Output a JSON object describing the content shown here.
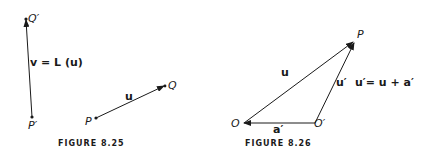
{
  "figure_8_25": {
    "caption": "FIGURE 8.25",
    "points": {
      "q_prime": "Q′",
      "p_prime": "P′",
      "p": "P",
      "q": "Q"
    },
    "vector_v_label": "v = L (u)",
    "vector_u_label": "u"
  },
  "figure_8_26": {
    "caption": "FIGURE 8.26",
    "points": {
      "o": "O",
      "o_prime": "O′",
      "p": "P"
    },
    "vector_u_label": "u",
    "vector_u_prime_label": "u′",
    "vector_a_prime_label": "a′",
    "equation": "u′= u + a′"
  },
  "colors": {
    "ink": "#1a1a1a",
    "background": "#ffffff"
  }
}
